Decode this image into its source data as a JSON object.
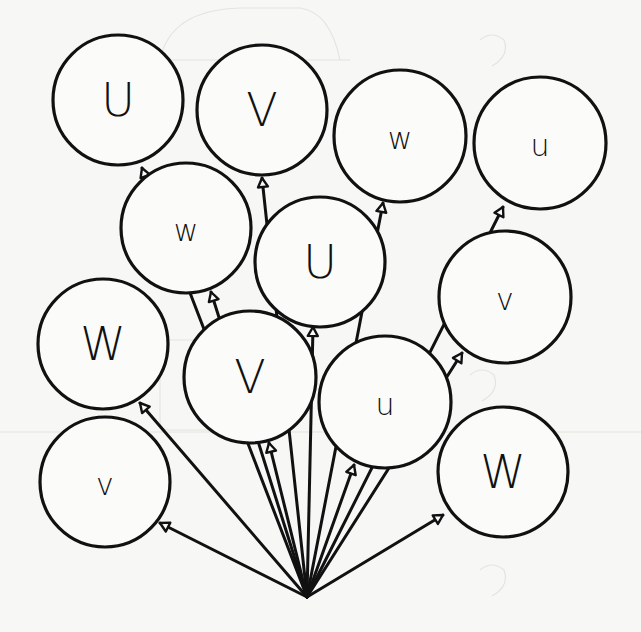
{
  "worksheet": {
    "title": "",
    "description": "Letter balloons tied to a single point",
    "colors": {
      "background": "#f7f7f5",
      "ink": "#111111",
      "balloon_fill": "#fbfbf9"
    },
    "anchor": {
      "x": 307,
      "y": 597
    },
    "balloons": [
      {
        "letter": "U",
        "case": "upper",
        "cx": 118,
        "cy": 100,
        "r": 65,
        "knot": {
          "x": 142,
          "y": 168
        },
        "size": 46
      },
      {
        "letter": "V",
        "case": "upper",
        "cx": 262,
        "cy": 110,
        "r": 65,
        "knot": {
          "x": 262,
          "y": 178
        },
        "size": 46
      },
      {
        "letter": "w",
        "case": "lower",
        "cx": 400,
        "cy": 136,
        "r": 66,
        "knot": {
          "x": 383,
          "y": 203
        },
        "size": 30
      },
      {
        "letter": "u",
        "case": "lower",
        "cx": 540,
        "cy": 143,
        "r": 66,
        "knot": {
          "x": 503,
          "y": 207
        },
        "size": 30
      },
      {
        "letter": "w",
        "case": "lower",
        "cx": 186,
        "cy": 228,
        "r": 65,
        "knot": {
          "x": 211,
          "y": 292
        },
        "size": 30
      },
      {
        "letter": "U",
        "case": "upper",
        "cx": 320,
        "cy": 262,
        "r": 65,
        "knot": {
          "x": 313,
          "y": 327
        },
        "size": 46
      },
      {
        "letter": "v",
        "case": "lower",
        "cx": 505,
        "cy": 297,
        "r": 66,
        "knot": {
          "x": 462,
          "y": 353
        },
        "size": 30
      },
      {
        "letter": "W",
        "case": "upper",
        "cx": 103,
        "cy": 344,
        "r": 65,
        "knot": {
          "x": 140,
          "y": 403
        },
        "size": 46
      },
      {
        "letter": "V",
        "case": "upper",
        "cx": 250,
        "cy": 377,
        "r": 66,
        "knot": {
          "x": 269,
          "y": 443
        },
        "size": 46
      },
      {
        "letter": "u",
        "case": "lower",
        "cx": 385,
        "cy": 402,
        "r": 66,
        "knot": {
          "x": 354,
          "y": 465
        },
        "size": 30
      },
      {
        "letter": "v",
        "case": "lower",
        "cx": 105,
        "cy": 482,
        "r": 65,
        "knot": {
          "x": 160,
          "y": 523
        },
        "size": 30
      },
      {
        "letter": "W",
        "case": "upper",
        "cx": 503,
        "cy": 472,
        "r": 65,
        "knot": {
          "x": 443,
          "y": 515
        },
        "size": 46
      }
    ]
  }
}
